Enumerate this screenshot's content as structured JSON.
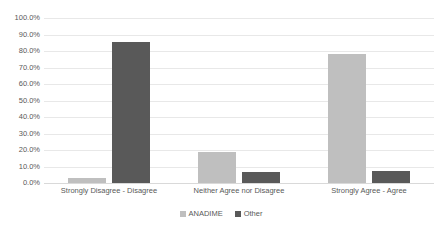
{
  "chart_data": {
    "type": "bar",
    "title": "",
    "subtitle": "",
    "xlabel": "",
    "ylabel": "",
    "ylim": [
      0,
      100
    ],
    "ytick_labels": [
      "100.0%",
      "90.0%",
      "80.0%",
      "70.0%",
      "60.0%",
      "50.0%",
      "40.0%",
      "30.0%",
      "20.0%",
      "10.0%",
      "0.0%"
    ],
    "ytick_values": [
      100,
      90,
      80,
      70,
      60,
      50,
      40,
      30,
      20,
      10,
      0
    ],
    "grid": "horizontal",
    "legend_position": "bottom-center",
    "categories": [
      "Strongly Disagree - Disagree",
      "Neither Agree nor Disagree",
      "Strongly Agree - Agree"
    ],
    "series": [
      {
        "name": "ANADIME",
        "color": "#bfbfbf",
        "values": [
          3.0,
          18.5,
          78.0
        ]
      },
      {
        "name": "Other",
        "color": "#595959",
        "values": [
          85.5,
          6.5,
          7.0
        ]
      }
    ]
  },
  "colors": {
    "series_anadime": "#bfbfbf",
    "series_other": "#595959",
    "gridline": "#e8e8e8",
    "text": "#595959",
    "background": "#ffffff"
  }
}
